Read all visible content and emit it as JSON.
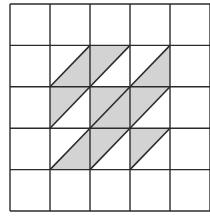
{
  "diagram": {
    "type": "grid-tiling",
    "rows": 5,
    "cols": 5,
    "grid_origin": [
      10,
      4
    ],
    "cell_width": 40,
    "cell_height": 41.4,
    "line_color": "#2b2b2b",
    "shade_color": "#d3d3d3",
    "background": "#ffffff",
    "diagonal_direction": "bottom-left-to-top-right",
    "shaded_cells": [
      {
        "row": 1,
        "col": 1,
        "part": "lower-right"
      },
      {
        "row": 1,
        "col": 2,
        "part": "upper-left"
      },
      {
        "row": 1,
        "col": 3,
        "part": "lower-right"
      },
      {
        "row": 2,
        "col": 1,
        "part": "upper-left"
      },
      {
        "row": 2,
        "col": 2,
        "part": "full"
      },
      {
        "row": 2,
        "col": 3,
        "part": "upper-left"
      },
      {
        "row": 3,
        "col": 1,
        "part": "lower-right"
      },
      {
        "row": 3,
        "col": 2,
        "part": "upper-left"
      },
      {
        "row": 3,
        "col": 3,
        "part": "upper-left"
      }
    ]
  }
}
